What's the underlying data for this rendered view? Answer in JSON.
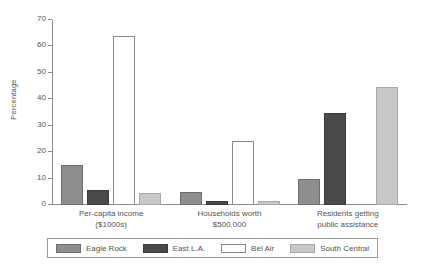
{
  "chart_data": {
    "type": "bar",
    "title": "",
    "xlabel": "",
    "ylabel": "Percentage",
    "ylim": [
      0,
      70
    ],
    "yticks": [
      0,
      10,
      20,
      30,
      40,
      50,
      60,
      70
    ],
    "grid": false,
    "legend_position": "bottom",
    "categories": [
      "Per-capita income ($1000s)",
      "Households worth $500,000",
      "Residents getting public assistance"
    ],
    "category_lines": [
      [
        "Per-capita income",
        "($1000s)"
      ],
      [
        "Households worth",
        "$500,000"
      ],
      [
        "Residents getting",
        "public assistance"
      ]
    ],
    "series": [
      {
        "name": "Eagle Rock",
        "key": "eagle",
        "color": "#8e8e8e",
        "values": [
          15.2,
          4.8,
          9.9
        ]
      },
      {
        "name": "East L.A.",
        "key": "east",
        "color": "#4a4a4a",
        "values": [
          5.5,
          1.5,
          34.8
        ]
      },
      {
        "name": "Bel Air",
        "key": "bel",
        "color": "#ffffff",
        "values": [
          64.0,
          24.2,
          0
        ]
      },
      {
        "name": "South Central",
        "key": "south",
        "color": "#c8c8c8",
        "values": [
          4.7,
          1.7,
          44.6
        ]
      }
    ]
  },
  "axis": {
    "tick_labels": [
      "70",
      "60",
      "50",
      "40",
      "30",
      "20",
      "10",
      "0"
    ],
    "y_title": "Percentage"
  },
  "legend": {
    "items": [
      {
        "label": "Eagle Rock",
        "key": "eagle"
      },
      {
        "label": "East L.A.",
        "key": "east"
      },
      {
        "label": "Bel Air",
        "key": "bel"
      },
      {
        "label": "South Central",
        "key": "south"
      }
    ]
  }
}
